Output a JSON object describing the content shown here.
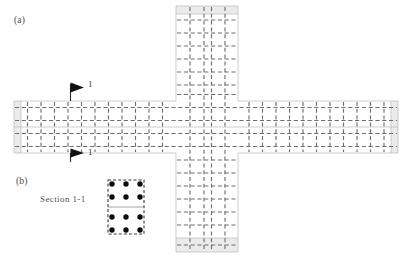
{
  "figure": {
    "type": "structural-plan-diagram",
    "panel_a": {
      "label": "(a)",
      "description": "cruciform slab plan with orthogonal dashed grid"
    },
    "panel_b": {
      "label": "(b)",
      "caption": "Section 1-1"
    },
    "section_markers": [
      {
        "name": "top",
        "number": "1",
        "direction": "right"
      },
      {
        "name": "bottom",
        "number": "1",
        "direction": "right"
      }
    ],
    "colors": {
      "band_fill": "#ebebeb",
      "outline": "#b9b9b9",
      "grid_dash": "#6f6f6f",
      "rebar": "#0d0d0d",
      "text": "#4a4a4a"
    },
    "geometry": {
      "horizontal_arm": {
        "x": 14,
        "y": 101,
        "width": 384,
        "height": 52
      },
      "vertical_arm": {
        "x": 176,
        "y": 6,
        "width": 62,
        "height": 246
      },
      "grid_pitch_x": 13.6,
      "grid_pitch_y": 13.0,
      "edge_band_width": 7,
      "mid_line_y": 127
    },
    "section_detail": {
      "x": 108,
      "y": 180,
      "width": 36,
      "height": 54,
      "rebar_columns": 3,
      "rebar_rows": 4,
      "rebar_count": 12,
      "mid_line": true
    }
  }
}
